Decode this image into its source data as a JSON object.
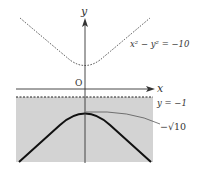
{
  "diagram": {
    "axes": {
      "x_label": "x",
      "y_label": "y",
      "origin_label": "O"
    },
    "curves": [
      {
        "name": "upper-hyperbola",
        "equation_label": "x² − y² = −10",
        "style": "dashed"
      },
      {
        "name": "lower-hyperbola-branch",
        "style": "solid-bold"
      }
    ],
    "lines": [
      {
        "name": "boundary-line",
        "label": "y = −1",
        "style": "dashed"
      }
    ],
    "annotations": {
      "vertex_label": "−√10"
    },
    "region": {
      "description": "shaded region y < −1",
      "fill": "#d3d3d3"
    }
  }
}
